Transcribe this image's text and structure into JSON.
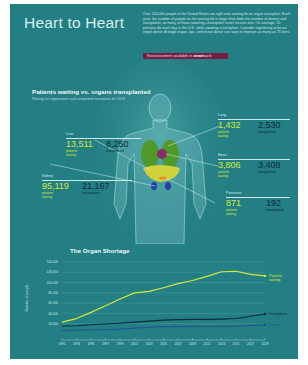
{
  "header": {
    "title": "Heart to Heart",
    "intro": "Over 100,000 people in the United States are right now waiting for an organ transplant. Each year, the number of people on the waiting list is larger than both the number of donors and transplants, so many of those awaiting a transplant never receive one. On average, 20 persons die each day in the U.S. while awaiting a transplant. Consider registering to be an organ donor. A single organ, eye, and tissue donor can save or improve as many as 75 lives.",
    "badge_prefix": "Reassessment available in ",
    "badge_brand": "smart",
    "badge_suffix": "work"
  },
  "organs_section": {
    "title": "Patients waiting vs. organs transplanted",
    "subtitle": "Waiting list registrations and completed transplants for 2018",
    "waiting_label": "patients waiting",
    "transplanted_label": "transplanted",
    "organs": [
      {
        "name": "Lung",
        "waiting": "1,432",
        "transplanted": "2,530"
      },
      {
        "name": "Liver",
        "waiting": "13,511",
        "transplanted": "8,250"
      },
      {
        "name": "Heart",
        "waiting": "3,806",
        "transplanted": "3,408"
      },
      {
        "name": "Kidney",
        "waiting": "95,119",
        "transplanted": "21,167"
      },
      {
        "name": "Pancreas",
        "waiting": "871",
        "transplanted": "192"
      }
    ]
  },
  "colors": {
    "background": "#237f83",
    "waiting": "#d6e83a",
    "transplants": "#0f2a3a",
    "donors": "#1f4f9a",
    "badge": "#7a1c44"
  },
  "chart_data": {
    "type": "line",
    "title": "The Organ Shortage",
    "xlabel": "",
    "ylabel": "Number of people",
    "ylim": [
      0,
      140000
    ],
    "yticks": [
      "140,000",
      "120,000",
      "100,000",
      "80,000",
      "60,000",
      "40,000",
      "20,000"
    ],
    "xticks": [
      "1991",
      "1993",
      "1995",
      "1997",
      "1999",
      "2001",
      "2003",
      "2005",
      "2007",
      "2009",
      "2011",
      "2013",
      "2015",
      "2017",
      "2019"
    ],
    "grid": true,
    "legend_position": "inline-right",
    "x": [
      1991,
      1993,
      1995,
      1997,
      1999,
      2001,
      2003,
      2005,
      2007,
      2009,
      2011,
      2013,
      2015,
      2017,
      2019
    ],
    "series": [
      {
        "name": "Patients waiting",
        "values": [
          23000,
          30000,
          42000,
          55000,
          68000,
          80000,
          83000,
          90000,
          98000,
          104000,
          112000,
          121000,
          122000,
          116000,
          113000
        ]
      },
      {
        "name": "Transplants",
        "values": [
          15000,
          16000,
          18000,
          19500,
          21000,
          23000,
          25000,
          27000,
          28000,
          28500,
          28500,
          29000,
          30000,
          34500,
          39000
        ]
      },
      {
        "name": "Donors",
        "values": [
          6900,
          7500,
          8000,
          8500,
          9500,
          11500,
          13000,
          14000,
          14500,
          14500,
          14500,
          14500,
          15000,
          16500,
          18000
        ]
      }
    ]
  }
}
